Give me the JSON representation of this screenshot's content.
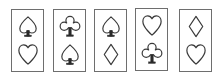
{
  "figure": {
    "title": "",
    "background_color": "#ffffff",
    "card_border_color": "#6e6e6e",
    "card_fill_color": "#ffffff",
    "glyph_outline_color": "#3a3a3a",
    "glyph_fill_color": "#ffffff",
    "glyph_stem_color": "#2b2b2b",
    "card_count": 5,
    "symbols_per_card": 2
  },
  "cards": [
    {
      "index": 1,
      "name": "card-1",
      "top_symbol": {
        "icon": "spade-icon",
        "label": "spade",
        "glyph": "♠"
      },
      "bottom_symbol": {
        "icon": "heart-icon",
        "label": "heart",
        "glyph": "♥"
      }
    },
    {
      "index": 2,
      "name": "card-2",
      "top_symbol": {
        "icon": "club-icon",
        "label": "club",
        "glyph": "♣"
      },
      "bottom_symbol": {
        "icon": "spade-icon",
        "label": "spade",
        "glyph": "♠"
      }
    },
    {
      "index": 3,
      "name": "card-3",
      "top_symbol": {
        "icon": "spade-icon",
        "label": "spade",
        "glyph": "♠"
      },
      "bottom_symbol": {
        "icon": "diamond-icon",
        "label": "diamond",
        "glyph": "♦"
      }
    },
    {
      "index": 4,
      "name": "card-4",
      "top_symbol": {
        "icon": "heart-icon",
        "label": "heart",
        "glyph": "♥"
      },
      "bottom_symbol": {
        "icon": "club-icon",
        "label": "club",
        "glyph": "♣"
      }
    },
    {
      "index": 5,
      "name": "card-5",
      "top_symbol": {
        "icon": "diamond-icon",
        "label": "diamond",
        "glyph": "♦"
      },
      "bottom_symbol": {
        "icon": "heart-icon",
        "label": "heart",
        "glyph": "♥"
      }
    }
  ]
}
